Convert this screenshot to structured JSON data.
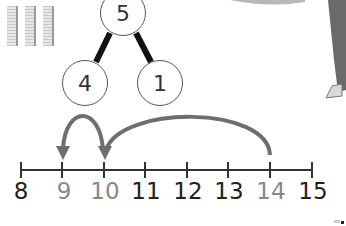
{
  "part_whole_model": {
    "whole": "5",
    "parts": [
      "4",
      "1"
    ]
  },
  "base_ten_rods": {
    "count": 3
  },
  "number_line": {
    "start": 8,
    "end": 15,
    "labels": [
      "8",
      "9",
      "10",
      "11",
      "12",
      "13",
      "14",
      "15"
    ],
    "highlighted_labels": [
      "9",
      "10",
      "14"
    ],
    "jumps": [
      {
        "from": 14,
        "to": 10,
        "size": 4
      },
      {
        "from": 10,
        "to": 9,
        "size": 1
      }
    ]
  },
  "colors": {
    "label_dark": "#222222",
    "label_highlight": "#888888",
    "arrow": "#6e6e6e",
    "line": "#333333"
  }
}
